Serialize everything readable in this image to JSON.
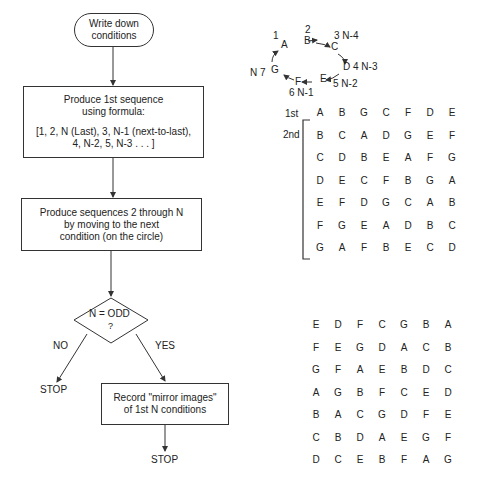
{
  "flowchart": {
    "start": {
      "line1": "Write down",
      "line2": "conditions"
    },
    "step1": {
      "line1": "Produce 1st sequence",
      "line2": "using formula:",
      "line3": "[1, 2, N (Last), 3, N-1 (next-to-last),",
      "line4": "4, N-2, 5, N-3 . . . ]"
    },
    "step2": {
      "line1": "Produce sequences 2 through N",
      "line2": "by moving to the next",
      "line3": "condition (on the circle)"
    },
    "decision": {
      "line1": "N = ODD",
      "line2": "?"
    },
    "no_label": "NO",
    "yes_label": "YES",
    "stop_no": "STOP",
    "step3": {
      "line1": "Record \"mirror images\"",
      "line2": "of 1st N conditions"
    },
    "stop_yes": "STOP"
  },
  "circle": {
    "nodes": [
      {
        "letter": "A",
        "label": "1"
      },
      {
        "letter": "B",
        "label": "2"
      },
      {
        "letter": "C",
        "label": "3 N-4"
      },
      {
        "letter": "D",
        "label": "4 N-3"
      },
      {
        "letter": "E",
        "label": "5 N-2"
      },
      {
        "letter": "F",
        "label": "6 N-1"
      },
      {
        "letter": "G",
        "label": "N 7"
      }
    ]
  },
  "sequences": {
    "row_label_1st": "1st",
    "row_label_2nd": "2nd",
    "rows": [
      [
        "A",
        "B",
        "G",
        "C",
        "F",
        "D",
        "E"
      ],
      [
        "B",
        "C",
        "A",
        "D",
        "G",
        "E",
        "F"
      ],
      [
        "C",
        "D",
        "B",
        "E",
        "A",
        "F",
        "G"
      ],
      [
        "D",
        "E",
        "C",
        "F",
        "B",
        "G",
        "A"
      ],
      [
        "E",
        "F",
        "D",
        "G",
        "C",
        "A",
        "B"
      ],
      [
        "F",
        "G",
        "E",
        "A",
        "D",
        "B",
        "C"
      ],
      [
        "G",
        "A",
        "F",
        "B",
        "E",
        "C",
        "D"
      ]
    ]
  },
  "mirror": {
    "rows": [
      [
        "E",
        "D",
        "F",
        "C",
        "G",
        "B",
        "A"
      ],
      [
        "F",
        "E",
        "G",
        "D",
        "A",
        "C",
        "B"
      ],
      [
        "G",
        "F",
        "A",
        "E",
        "B",
        "D",
        "C"
      ],
      [
        "A",
        "G",
        "B",
        "F",
        "C",
        "E",
        "D"
      ],
      [
        "B",
        "A",
        "C",
        "G",
        "D",
        "F",
        "E"
      ],
      [
        "C",
        "B",
        "D",
        "A",
        "E",
        "G",
        "F"
      ],
      [
        "D",
        "C",
        "E",
        "B",
        "F",
        "A",
        "G"
      ]
    ]
  }
}
